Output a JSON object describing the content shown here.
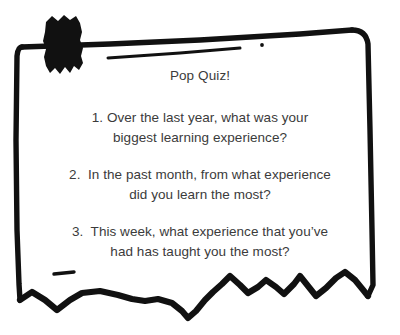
{
  "colors": {
    "ink": "#111111",
    "text": "#3b3b3b",
    "background": "#ffffff"
  },
  "card": {
    "title": "Pop Quiz!",
    "questions": [
      {
        "number": "1.",
        "line1": "1. Over the last year, what was your",
        "line2": "biggest learning experience?"
      },
      {
        "number": "2.",
        "line1": "2.  In the past month, from what experience",
        "line2": "did you learn the most?"
      },
      {
        "number": "3.",
        "line1": "3.  This week, what experience that you’ve",
        "line2": "had has taught you the most?"
      }
    ]
  },
  "decorations": {
    "frame_label": "hand-drawn-torn-paper-frame",
    "blob_label": "black-ink-blob",
    "zigzag_label": "torn-bottom-edge",
    "dash_label": "small-ink-dash",
    "dot_label": "small-ink-dot",
    "stroke_label": "diagonal-ink-stroke"
  }
}
